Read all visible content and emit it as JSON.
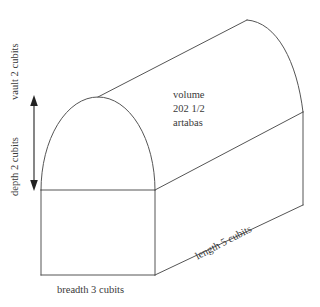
{
  "figure": {
    "type": "geometry-diagram",
    "line_color": "#555555",
    "background_color": "#ffffff",
    "text_color": "#3a3a3a"
  },
  "labels": {
    "volume_line1": "volume",
    "volume_line2": "202 1/2",
    "volume_line3": "artabas",
    "breadth": "breadth 3 cubits",
    "length": "length 5 cubits",
    "vault": "vault 2 cubits",
    "depth": "depth 2 cubits"
  },
  "measurements": {
    "breadth_value": "3",
    "breadth_unit": "cubits",
    "length_value": "5",
    "length_unit": "cubits",
    "vault_value": "2",
    "vault_unit": "cubits",
    "depth_value": "2",
    "depth_unit": "cubits",
    "volume_value": "202 1/2",
    "volume_unit": "artabas"
  }
}
